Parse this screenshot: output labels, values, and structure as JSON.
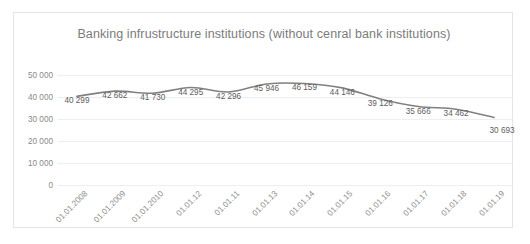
{
  "chart_data": {
    "type": "line",
    "title": "Banking infrustructure institutions (without cenral bank institutions)",
    "xlabel": "",
    "ylabel": "",
    "ylim": [
      0,
      50000
    ],
    "yticks": [
      0,
      10000,
      20000,
      30000,
      40000,
      50000
    ],
    "ytick_labels": [
      "0",
      "10 000",
      "20 000",
      "30 000",
      "40 000",
      "50 000"
    ],
    "grid": true,
    "legend": "none",
    "line_color": "#808080",
    "line_style": "smooth",
    "categories": [
      "01.01.2008",
      "01.01.2009",
      "01.01.2010",
      "01.01.12",
      "01.01.11",
      "01.01.13",
      "01.01.14",
      "01.01.15",
      "01.01.16",
      "01.01.17",
      "01.01.18",
      "01.01.19"
    ],
    "values": [
      40299,
      42662,
      41730,
      44295,
      42296,
      45946,
      46159,
      44146,
      39126,
      35666,
      34462,
      30693
    ],
    "data_labels": [
      "40 299",
      "42 662",
      "41 730",
      "44 295",
      "42 296",
      "45 946",
      "46 159",
      "44 146",
      "39 126",
      "35 666",
      "34 462",
      "30 693"
    ]
  }
}
